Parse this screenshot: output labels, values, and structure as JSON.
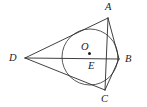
{
  "figure": {
    "kind": "plane-geometry-diagram",
    "canvas": {
      "width": 147,
      "height": 107,
      "background": "#ffffff"
    },
    "stroke_color": "#2b2b2b",
    "label_color": "#1c1c1c"
  },
  "labels": {
    "a": "A",
    "b": "B",
    "c": "C",
    "d": "D",
    "e": "E",
    "o": "O"
  },
  "label_positions": {
    "a": {
      "x": 105,
      "y": 2
    },
    "b": {
      "x": 125,
      "y": 54
    },
    "c": {
      "x": 101,
      "y": 94
    },
    "d": {
      "x": 9,
      "y": 53
    },
    "e": {
      "x": 88,
      "y": 61
    },
    "o": {
      "x": 81,
      "y": 42
    }
  },
  "geometry": {
    "circle": {
      "cx": 90,
      "cy": 57,
      "r": 28
    },
    "center_dot": {
      "cx": 89.5,
      "cy": 53.5,
      "r": 1.5
    },
    "points": {
      "A": {
        "x": 108,
        "y": 18
      },
      "B": {
        "x": 119,
        "y": 59
      },
      "C": {
        "x": 105,
        "y": 90
      },
      "D": {
        "x": 25,
        "y": 58
      },
      "E": {
        "x": 107,
        "y": 59
      }
    },
    "segments": [
      {
        "name": "DA",
        "from": "D",
        "to": "A"
      },
      {
        "name": "AB",
        "from": "A",
        "to": "B"
      },
      {
        "name": "BC",
        "from": "B",
        "to": "C"
      },
      {
        "name": "CD",
        "from": "C",
        "to": "D"
      },
      {
        "name": "DB",
        "from": "D",
        "to": "B"
      },
      {
        "name": "AC",
        "from": "A",
        "to": "C"
      }
    ]
  }
}
